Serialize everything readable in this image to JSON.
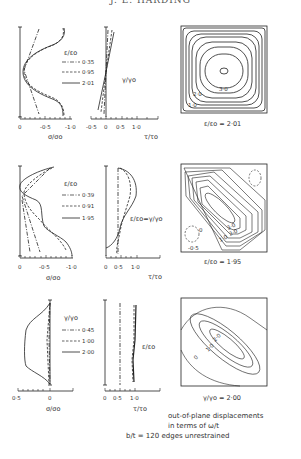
{
  "header": {
    "author": "J. E. HARDING"
  },
  "panels": [
    {
      "row": 1,
      "legend_title": "ε/εo",
      "legend": [
        {
          "style": "dash-dot",
          "label": "0·35"
        },
        {
          "style": "dashed",
          "label": "0·95"
        },
        {
          "style": "solid",
          "label": "2·01"
        }
      ],
      "sigma_axis": {
        "ticks": [
          "0",
          "-0·5",
          "-1·0"
        ],
        "label": "σ/σo"
      },
      "tau_axis": {
        "ticks": [
          "-0·5",
          "0",
          "0·5",
          "1·0"
        ],
        "label": "τ/τo"
      },
      "tau_annotation": "γ/γo",
      "contour_labels": [
        "3·0",
        "2·0",
        "1·0"
      ],
      "contour_caption": "ε/εo = 2·01"
    },
    {
      "row": 2,
      "legend_title": "ε/εo",
      "legend": [
        {
          "style": "dash-dot",
          "label": "0·39"
        },
        {
          "style": "dashed",
          "label": "0·91"
        },
        {
          "style": "solid",
          "label": "1·95"
        }
      ],
      "sigma_axis": {
        "ticks": [
          "0",
          "-0·5",
          "-1·0"
        ],
        "label": "σ/σo"
      },
      "tau_axis": {
        "ticks": [
          "0",
          "0·5",
          "1·0"
        ],
        "label": "τ/τo"
      },
      "tau_annotation": "ε/εo=γ/γo",
      "contour_labels": [
        "3·0",
        "2·0",
        "1·0",
        "0",
        "-0·5"
      ],
      "contour_caption": "ε/εo = 1·95"
    },
    {
      "row": 3,
      "legend_title": "γ/γo",
      "legend": [
        {
          "style": "dash-dot",
          "label": "0·45"
        },
        {
          "style": "dashed",
          "label": "1·00"
        },
        {
          "style": "solid",
          "label": "2·00"
        }
      ],
      "sigma_axis": {
        "ticks": [
          "0·5",
          "0"
        ],
        "label": "σ/σo"
      },
      "tau_axis": {
        "ticks": [
          "0",
          "0·5",
          "1·0"
        ],
        "label": "τ/τo"
      },
      "tau_annotation": "ε/εo",
      "contour_labels": [
        "2·0",
        "1·0",
        "0"
      ],
      "contour_caption": "γ/γo = 2·00"
    }
  ],
  "footer": {
    "line1": "out-of-plane displacements",
    "line2": "in terms of ω/t",
    "line3": "b/t = 120 edges unrestrained"
  }
}
